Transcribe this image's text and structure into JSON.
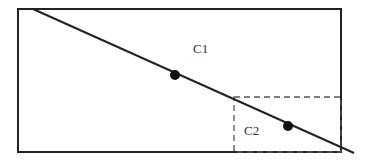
{
  "diagram": {
    "colors": {
      "stroke": "#222222",
      "dashed": "#555555",
      "point": "#111111",
      "label": "#333333",
      "background": "#ffffff"
    },
    "outer_rect": {
      "x": 18,
      "y": 9,
      "width": 323,
      "height": 143
    },
    "inner_rect": {
      "x": 234,
      "y": 97,
      "width": 107,
      "height": 55,
      "style": "dashed"
    },
    "line": {
      "x1": 33,
      "y1": 9,
      "x2": 354,
      "y2": 153
    },
    "points": [
      {
        "cx": 175,
        "cy": 75,
        "r": 5
      },
      {
        "cx": 288,
        "cy": 126,
        "r": 5
      }
    ],
    "labels": {
      "c1": {
        "text": "C1",
        "x": 193,
        "y": 53
      },
      "c2": {
        "text": "C2",
        "x": 244,
        "y": 135
      }
    }
  }
}
